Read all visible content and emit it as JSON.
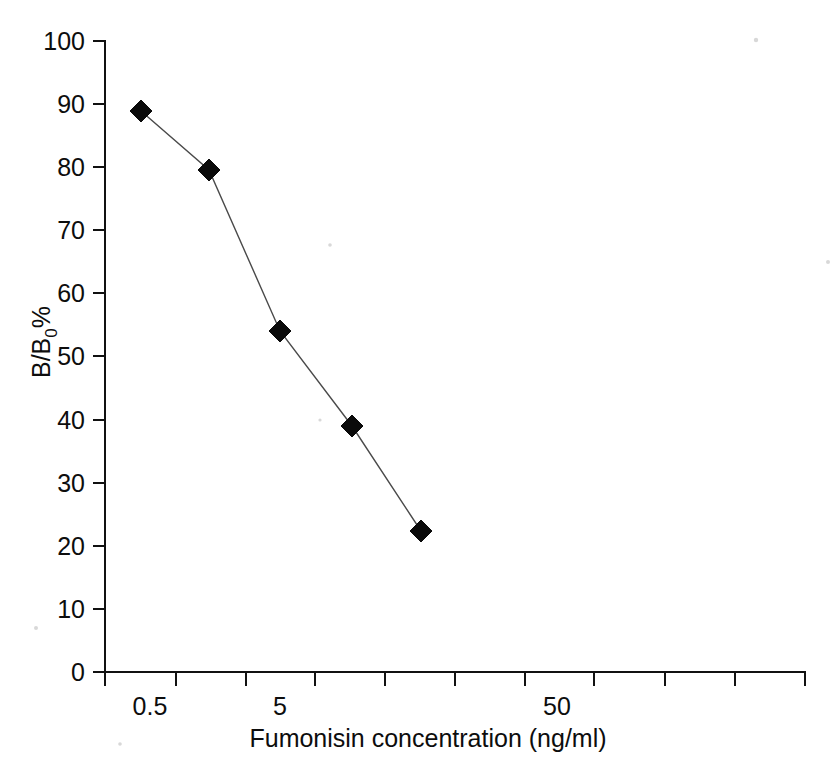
{
  "chart_data": {
    "type": "line",
    "title": "",
    "xlabel": "Fumonisin concentration (ng/ml)",
    "ylabel": "B/B0%",
    "ylabel_main": "B/B",
    "ylabel_subscript": "0",
    "ylabel_suffix": "%",
    "x_scale": "log",
    "x_tick_labels": [
      "0.5",
      "5",
      "50"
    ],
    "y_tick_labels": [
      "0",
      "10",
      "20",
      "30",
      "40",
      "50",
      "60",
      "70",
      "80",
      "90",
      "100"
    ],
    "ylim": [
      0,
      100
    ],
    "grid": false,
    "legend": "none",
    "series": [
      {
        "name": "Fumonisin standard curve",
        "marker": "filled-diamond",
        "marker_color": "#0a0a0a",
        "line_color": "#4a4a4a",
        "points": [
          {
            "x": 0.5,
            "y": 88.8,
            "px": 141,
            "py": 111
          },
          {
            "x": 1.2,
            "y": 79.4,
            "px": 209,
            "py": 170
          },
          {
            "x": 5.0,
            "y": 54.3,
            "px": 280,
            "py": 331
          },
          {
            "x": 11.0,
            "y": 39.2,
            "px": 352,
            "py": 426
          },
          {
            "x": 24.0,
            "y": 23.0,
            "px": 421,
            "py": 531
          }
        ]
      }
    ],
    "x_tick_px": [
      105,
      176,
      246,
      315,
      385,
      455,
      525,
      594,
      665,
      735,
      805
    ],
    "x_label_px": [
      150,
      280,
      557
    ],
    "y_tick_px": [
      672,
      609,
      546,
      483,
      420,
      356,
      293,
      230,
      167,
      104,
      41
    ],
    "axis_color": "#111111",
    "background": "#ffffff"
  }
}
